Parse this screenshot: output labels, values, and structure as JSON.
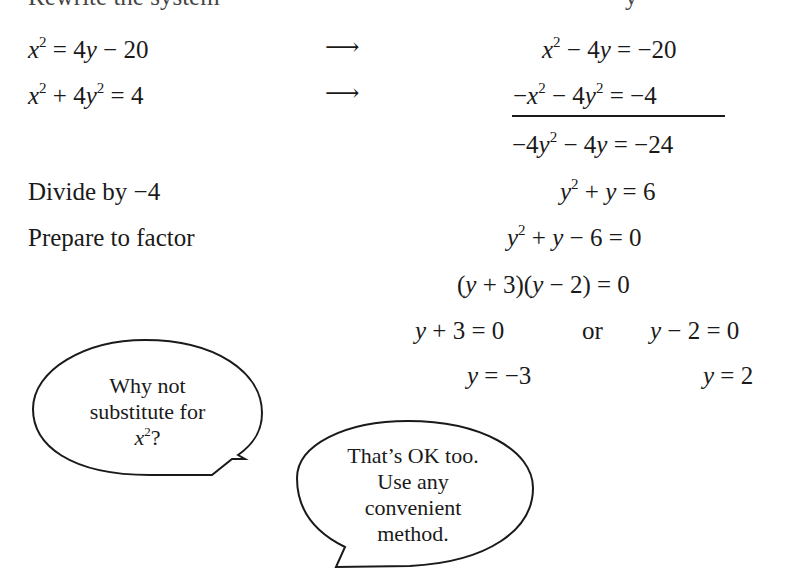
{
  "header": {
    "left_cut": "Rewrite the system",
    "right_cut": "y"
  },
  "rows": [
    {
      "left": "x² = 4y − 20",
      "arrow": "⟶",
      "right": "x² − 4y = −20"
    },
    {
      "left": "x² + 4y² = 4",
      "arrow": "⟶",
      "right": "−x² − 4y² = −4"
    }
  ],
  "sum": "−4y² − 4y = −24",
  "steps": [
    {
      "label": "Divide by −4",
      "expr": "y² + y = 6"
    },
    {
      "label": "Prepare to factor",
      "expr": "y² + y − 6 = 0"
    }
  ],
  "factored": "(y + 3)(y − 2) = 0",
  "cases": {
    "left": "y + 3 = 0",
    "connector": "or",
    "right": "y − 2 = 0"
  },
  "solutions": {
    "left": "y = −3",
    "right": "y = 2"
  },
  "bubbles": [
    {
      "lines": [
        "Why not",
        "substitute for",
        "x²?"
      ]
    },
    {
      "lines": [
        "That’s OK too.",
        "Use any",
        "convenient",
        "method."
      ]
    }
  ]
}
